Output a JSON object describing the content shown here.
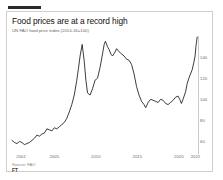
{
  "card": {
    "title": "Food prices are at a record high",
    "subtitle": "UN FAO food price index (2014-16=100)",
    "source": "Source: FAO",
    "logo": "FT"
  },
  "chart_data": {
    "type": "line",
    "title": "Food prices are at a record high",
    "subtitle": "UN FAO food price index (2014-16=100)",
    "xlabel": "",
    "ylabel": "",
    "xlim": [
      2000.0,
      2022.4
    ],
    "ylim": [
      50,
      160
    ],
    "grid": false,
    "legend": null,
    "line_color": "#1a1a1a",
    "xticks": [
      "2001",
      "2005",
      "2010",
      "2015",
      "2020",
      "2022"
    ],
    "xtick_values": [
      2001,
      2005,
      2010,
      2015,
      2020,
      2022
    ],
    "yticks": [
      "140",
      "120",
      "100",
      "80",
      "60"
    ],
    "ytick_values": [
      140,
      120,
      100,
      80,
      60
    ],
    "series": [
      {
        "name": "UN FAO food price index",
        "x": [
          2000.0,
          2000.3,
          2000.6,
          2000.9,
          2001.2,
          2001.5,
          2001.8,
          2002.1,
          2002.4,
          2002.7,
          2003.0,
          2003.3,
          2003.6,
          2003.9,
          2004.2,
          2004.5,
          2004.8,
          2005.1,
          2005.4,
          2005.7,
          2006.0,
          2006.3,
          2006.6,
          2006.9,
          2007.2,
          2007.5,
          2007.8,
          2008.0,
          2008.2,
          2008.45,
          2008.7,
          2008.9,
          2009.1,
          2009.4,
          2009.7,
          2010.0,
          2010.3,
          2010.6,
          2010.9,
          2011.1,
          2011.25,
          2011.5,
          2011.7,
          2011.9,
          2012.1,
          2012.35,
          2012.6,
          2012.9,
          2013.2,
          2013.5,
          2013.8,
          2014.1,
          2014.4,
          2014.7,
          2015.0,
          2015.3,
          2015.6,
          2015.9,
          2016.1,
          2016.4,
          2016.7,
          2017.0,
          2017.3,
          2017.6,
          2017.9,
          2018.2,
          2018.5,
          2018.8,
          2019.1,
          2019.4,
          2019.7,
          2020.0,
          2020.2,
          2020.4,
          2020.6,
          2020.9,
          2021.1,
          2021.3,
          2021.5,
          2021.7,
          2021.9,
          2022.05,
          2022.15,
          2022.3
        ],
        "y": [
          61,
          59,
          58,
          60,
          59,
          57,
          58,
          59,
          61,
          63,
          66,
          65,
          67,
          68,
          72,
          71,
          70,
          73,
          72,
          74,
          76,
          78,
          82,
          88,
          95,
          104,
          118,
          129,
          141,
          152,
          136,
          118,
          106,
          104,
          110,
          118,
          120,
          130,
          143,
          152,
          155,
          150,
          147,
          143,
          141,
          144,
          148,
          145,
          143,
          141,
          138,
          137,
          133,
          124,
          112,
          104,
          98,
          95,
          92,
          97,
          100,
          99,
          98,
          97,
          100,
          99,
          96,
          95,
          97,
          99,
          102,
          103,
          100,
          96,
          100,
          107,
          115,
          120,
          124,
          128,
          135,
          141,
          150,
          159
        ]
      }
    ],
    "annotation": "Record high reached at the right end of the series"
  }
}
